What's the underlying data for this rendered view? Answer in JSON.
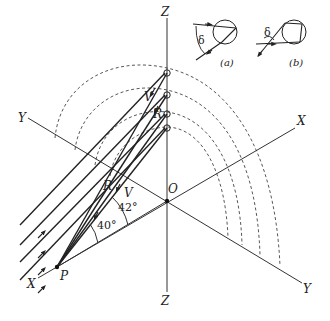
{
  "figure": {
    "type": "rainbow geometry diagram",
    "axis_labels": {
      "z_top": "Z",
      "z_bottom": "Z",
      "x_upper_right": "X",
      "x_lower_left": "X",
      "y_upper_left": "Y",
      "y_lower_right": "Y"
    },
    "points": {
      "origin": "O",
      "observer": "P"
    },
    "ray_labels": {
      "violet_upper": "V",
      "red_upper": "R",
      "red_lower": "R",
      "violet_lower": "V"
    },
    "angles": {
      "red_angle": "40°",
      "violet_angle": "42°"
    },
    "insets": {
      "a": {
        "caption": "(a)",
        "angle_symbol": "δ",
        "description": "primary rainbow: single internal reflection"
      },
      "b": {
        "caption": "(b)",
        "angle_symbol": "δ",
        "description": "secondary rainbow: double internal reflection"
      }
    },
    "colors": {
      "line": "#222222",
      "background": "#ffffff"
    }
  }
}
